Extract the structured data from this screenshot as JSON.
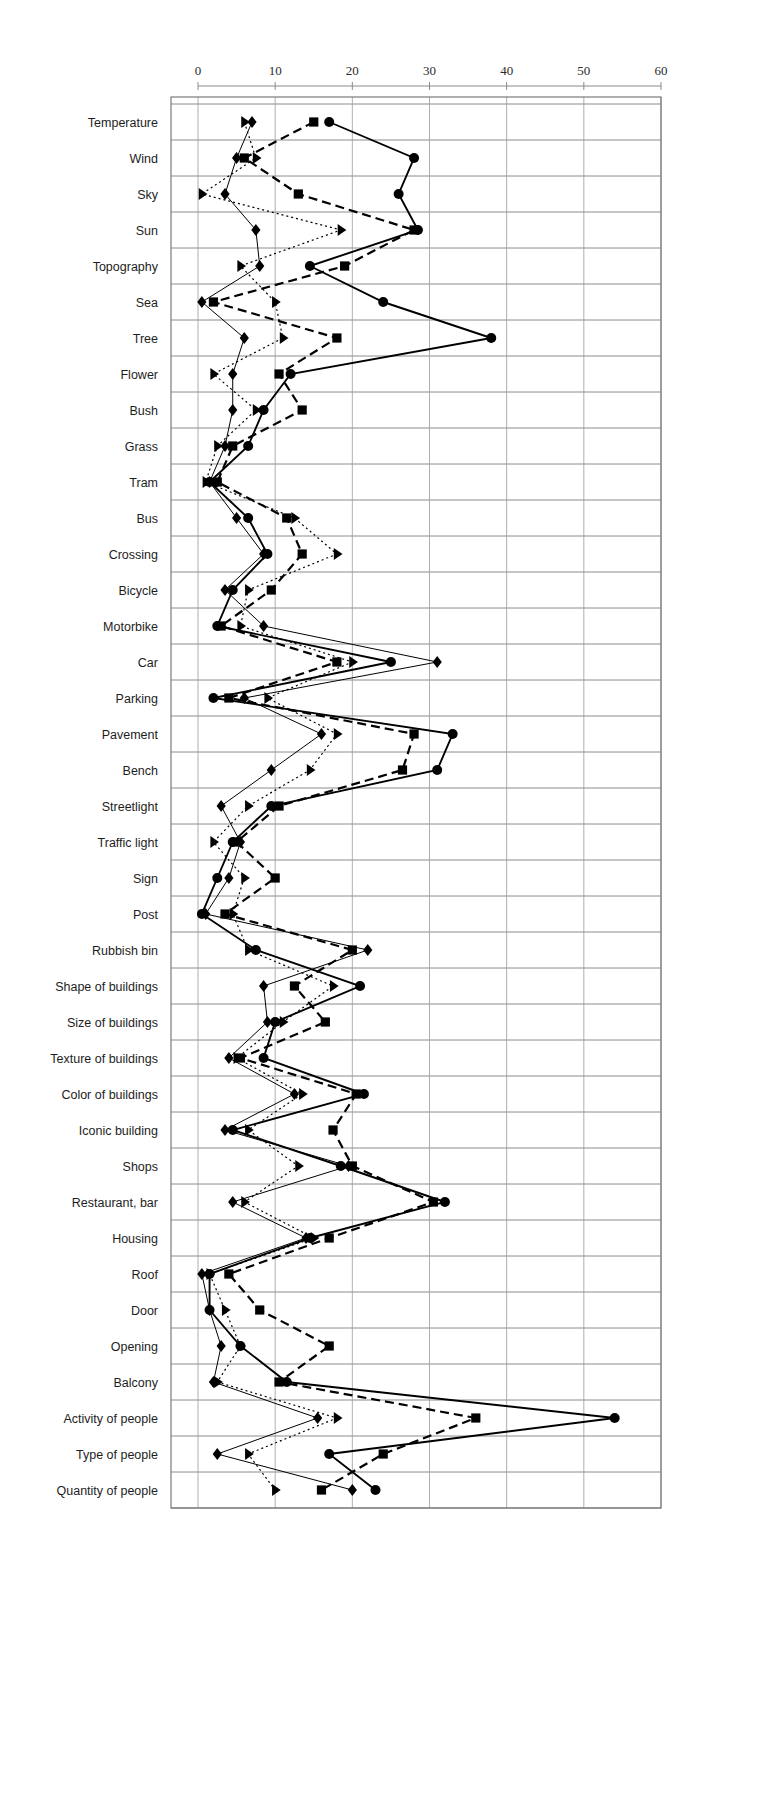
{
  "chart_data": {
    "type": "line",
    "orientation": "horizontal",
    "title": "",
    "subtitle": "",
    "xlabel": "",
    "ylabel": "",
    "xlim": [
      0,
      60
    ],
    "xticks": [
      0,
      10,
      20,
      30,
      40,
      50,
      60
    ],
    "xtick_labels": [
      "0",
      "10",
      "20",
      "30",
      "40",
      "50",
      "60"
    ],
    "grid": true,
    "grid_axes": "both",
    "legend": "none",
    "axis_position": "top",
    "categories": [
      "Temperature",
      "Wind",
      "Sky",
      "Sun",
      "Topography",
      "Sea",
      "Tree",
      "Flower",
      "Bush",
      "Grass",
      "Tram",
      "Bus",
      "Crossing",
      "Bicycle",
      "Motorbike",
      "Car",
      "Parking",
      "Pavement",
      "Bench",
      "Streetlight",
      "Traffic light",
      "Sign",
      "Post",
      "Rubbish bin",
      "Shape of buildings",
      "Size of buildings",
      "Texture of buildings",
      "Color of buildings",
      "Iconic building",
      "Shops",
      "Restaurant, bar",
      "Housing",
      "Roof",
      "Door",
      "Opening",
      "Balcony",
      "Activity of people",
      "Type of people",
      "Quantity of people"
    ],
    "series": [
      {
        "name": "series-circle",
        "marker": "circle",
        "line_style": "solid",
        "line_width": 1.9,
        "color": "#000000",
        "values": [
          17,
          28,
          26,
          28.5,
          14.5,
          24,
          38,
          12,
          8.5,
          6.5,
          1.5,
          6.5,
          9,
          4.5,
          2.5,
          25,
          2,
          33,
          31,
          9.5,
          4.5,
          2.5,
          0.5,
          7.5,
          21,
          10,
          8.5,
          21.5,
          4.5,
          18.5,
          32,
          14.5,
          1.5,
          1.5,
          5.5,
          11.5,
          54,
          17,
          23
        ]
      },
      {
        "name": "series-square",
        "marker": "square",
        "line_style": "dashed",
        "line_width": 2.2,
        "color": "#000000",
        "values": [
          15,
          6,
          13,
          28,
          19,
          2,
          18,
          10.5,
          13.5,
          4.5,
          2.5,
          11.5,
          13.5,
          9.5,
          3,
          18,
          4,
          28,
          26.5,
          10.5,
          5,
          10,
          3.5,
          20,
          12.5,
          16.5,
          5.5,
          20.5,
          17.5,
          20,
          30.5,
          17,
          4,
          8,
          17,
          10.5,
          36,
          24,
          16
        ]
      },
      {
        "name": "series-diamond",
        "marker": "diamond",
        "line_style": "thin",
        "line_width": 1.0,
        "color": "#000000",
        "values": [
          7,
          5,
          3.5,
          7.5,
          8,
          0.5,
          6,
          4.5,
          4.5,
          3.5,
          1.5,
          5,
          8.5,
          3.5,
          8.5,
          31,
          6,
          16,
          9.5,
          3,
          5.5,
          4,
          1,
          22,
          8.5,
          9,
          4,
          12.5,
          3.5,
          19.5,
          4.5,
          14,
          0.5,
          1.5,
          3,
          2,
          15.5,
          2.5,
          20
        ]
      },
      {
        "name": "series-triangle",
        "marker": "triangle",
        "line_style": "dotted",
        "line_width": 1.2,
        "color": "#000000",
        "values": [
          6,
          7.5,
          0.5,
          18.5,
          5.5,
          10,
          11,
          2,
          7.5,
          2.5,
          1,
          12.5,
          18,
          6.5,
          5.5,
          20,
          9,
          18,
          14.5,
          6.5,
          2,
          6,
          4.5,
          6.5,
          17.5,
          11,
          5,
          13.5,
          6.5,
          13,
          6,
          15,
          1.5,
          3.5,
          5.5,
          2.5,
          18,
          6.5,
          10
        ]
      }
    ]
  },
  "figure": {
    "background_color": "#ffffff",
    "line_color": "#000000",
    "grid_color": "#808080",
    "axis_color": "#8a8a8a"
  }
}
